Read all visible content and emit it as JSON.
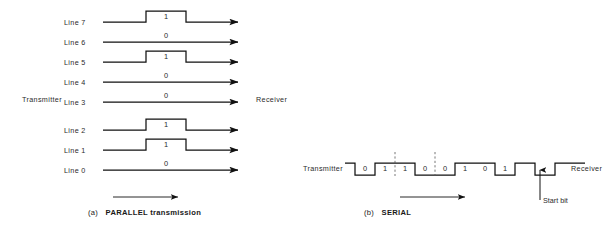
{
  "figure": {
    "panels": [
      {
        "id": "parallel",
        "caption_index": "(a)",
        "caption_text": "PARALLEL transmission",
        "transmitter_label": "Transmitter",
        "receiver_label": "Receiver",
        "lines": [
          {
            "label": "Line 7",
            "bit": "1",
            "high": true
          },
          {
            "label": "Line 6",
            "bit": "0",
            "high": false
          },
          {
            "label": "Line 5",
            "bit": "1",
            "high": true
          },
          {
            "label": "Line 4",
            "bit": "0",
            "high": false
          },
          {
            "label": "Line 3",
            "bit": "0",
            "high": false
          },
          {
            "label": "Line 2",
            "bit": "1",
            "high": true
          },
          {
            "label": "Line 1",
            "bit": "1",
            "high": true
          },
          {
            "label": "Line 0",
            "bit": "0",
            "high": false
          }
        ]
      },
      {
        "id": "serial",
        "caption_index": "(b)",
        "caption_text": "SERIAL",
        "transmitter_label": "Transmitter",
        "receiver_label": "Receiver",
        "annotation_label": "Start bit",
        "bits": [
          "0",
          "1",
          "1",
          "0",
          "0",
          "1",
          "0",
          "1"
        ]
      }
    ]
  },
  "colors": {
    "ink": "#1a1a1a",
    "text": "#2b2b2b",
    "background": "#ffffff"
  }
}
